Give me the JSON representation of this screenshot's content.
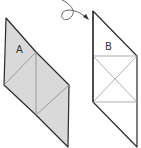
{
  "diagram": {
    "shape_a": {
      "label": "A",
      "fill": "#d9d9d9",
      "stroke": "#2b2b2b",
      "inner_stroke": "#8a8a8a"
    },
    "shape_b": {
      "label": "B",
      "fill": "#ffffff",
      "stroke": "#2b2b2b",
      "inner_stroke": "#9a9a9a"
    },
    "arrow": {
      "icon": "curly-arrow-icon",
      "stroke": "#555555"
    }
  }
}
